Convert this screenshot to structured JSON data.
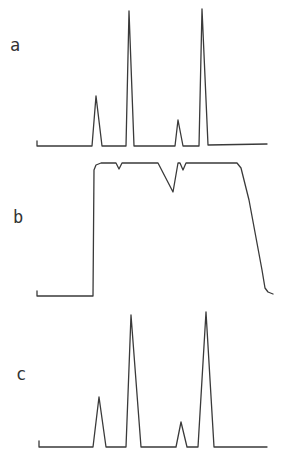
{
  "figure": {
    "panels": [
      {
        "label": "a",
        "type": "peak-trace",
        "description": "four sharp peaks (small, tall, small, tall)"
      },
      {
        "label": "b",
        "type": "plateau-trace",
        "description": "step up to plateau with small dips, then declining tail"
      },
      {
        "label": "c",
        "type": "peak-trace",
        "description": "four sharp peaks (small, tall, small, tall)"
      }
    ],
    "colors": {
      "line": "#3a3a3a",
      "label": "#333333",
      "background": "#ffffff"
    }
  },
  "chart_data": [
    {
      "type": "line",
      "title": "a",
      "xlabel": "",
      "ylabel": "",
      "grid": false,
      "points_px": [
        [
          37,
          141
        ],
        [
          37,
          146
        ],
        [
          92,
          146
        ],
        [
          96,
          96
        ],
        [
          102,
          146
        ],
        [
          126,
          146
        ],
        [
          129,
          11
        ],
        [
          134,
          146
        ],
        [
          175,
          146
        ],
        [
          178,
          120
        ],
        [
          183,
          146
        ],
        [
          199,
          146
        ],
        [
          202,
          9
        ],
        [
          208,
          145
        ],
        [
          267,
          144
        ]
      ],
      "peaks": [
        {
          "x": 96,
          "relative_height": 0.37
        },
        {
          "x": 129,
          "relative_height": 0.99
        },
        {
          "x": 178,
          "relative_height": 0.19
        },
        {
          "x": 202,
          "relative_height": 1.0
        }
      ]
    },
    {
      "type": "line",
      "title": "b",
      "xlabel": "",
      "ylabel": "",
      "grid": false,
      "points_px": [
        [
          37,
          291
        ],
        [
          37,
          296
        ],
        [
          93,
          296
        ],
        [
          94,
          170
        ],
        [
          96,
          165
        ],
        [
          101,
          163
        ],
        [
          116,
          163
        ],
        [
          119,
          169
        ],
        [
          122,
          163
        ],
        [
          158,
          163
        ],
        [
          173,
          192
        ],
        [
          178,
          163
        ],
        [
          180,
          163
        ],
        [
          183,
          170
        ],
        [
          186,
          163
        ],
        [
          237,
          163
        ],
        [
          241,
          168
        ],
        [
          249,
          200
        ],
        [
          262,
          270
        ],
        [
          265,
          288
        ],
        [
          268,
          292
        ],
        [
          273,
          294
        ]
      ],
      "dips": [
        {
          "x": 119,
          "relative_depth": 0.05
        },
        {
          "x": 173,
          "relative_depth": 0.22
        },
        {
          "x": 183,
          "relative_depth": 0.05
        }
      ]
    },
    {
      "type": "line",
      "title": "c",
      "xlabel": "",
      "ylabel": "",
      "grid": false,
      "points_px": [
        [
          39,
          441
        ],
        [
          39,
          447
        ],
        [
          93,
          447
        ],
        [
          99,
          397
        ],
        [
          106,
          447
        ],
        [
          126,
          447
        ],
        [
          131,
          315
        ],
        [
          141,
          447
        ],
        [
          176,
          447
        ],
        [
          181,
          422
        ],
        [
          187,
          447
        ],
        [
          198,
          447
        ],
        [
          206,
          312
        ],
        [
          214,
          447
        ],
        [
          267,
          447
        ]
      ],
      "peaks": [
        {
          "x": 99,
          "relative_height": 0.37
        },
        {
          "x": 131,
          "relative_height": 0.98
        },
        {
          "x": 181,
          "relative_height": 0.19
        },
        {
          "x": 206,
          "relative_height": 1.0
        }
      ]
    }
  ]
}
